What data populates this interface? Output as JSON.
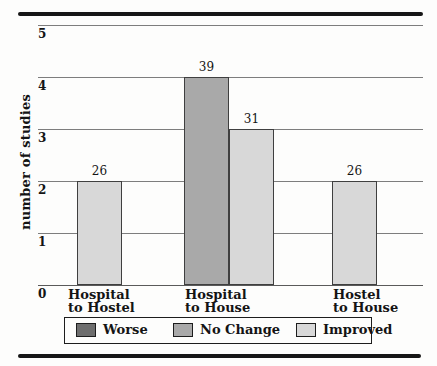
{
  "chart_data": {
    "type": "bar",
    "title": "",
    "xlabel": "",
    "ylabel": "number of studies",
    "ylim": [
      0,
      5
    ],
    "yticks": [
      0,
      1,
      2,
      3,
      4,
      5
    ],
    "grid": true,
    "legend_position": "bottom",
    "categories": [
      "Hospital to Hostel",
      "Hospital to House",
      "Hostel to House"
    ],
    "bars": [
      {
        "category": "Hospital to Hostel",
        "series": "Improved",
        "value": 2,
        "label": "26"
      },
      {
        "category": "Hospital to House",
        "series": "No Change",
        "value": 4,
        "label": "39"
      },
      {
        "category": "Hospital to House",
        "series": "Improved",
        "value": 3,
        "label": "31"
      },
      {
        "category": "Hostel to House",
        "series": "Improved",
        "value": 2,
        "label": "26"
      }
    ],
    "legend": [
      {
        "label": "Worse",
        "color": "#6e6e6e"
      },
      {
        "label": "No Change",
        "color": "#a9a9a9"
      },
      {
        "label": "Improved",
        "color": "#d8d8d8"
      }
    ]
  },
  "category_labels": [
    {
      "line1": "Hospital",
      "line2": "to Hostel"
    },
    {
      "line1": "Hospital",
      "line2": "to House"
    },
    {
      "line1": "Hostel",
      "line2": "to House"
    }
  ],
  "colors": {
    "worse": "#6e6e6e",
    "no_change": "#a9a9a9",
    "improved": "#d8d8d8",
    "gridline": "#7d7d7d",
    "bar_border": "#3f3f3f",
    "rule": "#161616",
    "text": "#141414",
    "background": "#fdfdfc"
  }
}
